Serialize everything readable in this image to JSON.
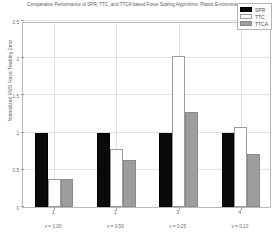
{
  "chart_data": {
    "type": "bar",
    "title": "Comparative Performance of SPR, TTC, and TTCA based Force Scaling Algorithms: Plastic Environment",
    "xlabel": "",
    "ylabel": "Normalized RMS Force Tracking Error",
    "categories": [
      "1",
      "2",
      "3",
      "4"
    ],
    "group_sublabels": [
      "v = 1.00",
      "v = 0.50",
      "v = 0.25",
      "v = 0.10"
    ],
    "series": [
      {
        "name": "SPR",
        "color": "#0a0a0a",
        "values": [
          1.0,
          1.0,
          1.0,
          1.0
        ]
      },
      {
        "name": "TTC",
        "color": "#ffffff",
        "values": [
          0.37,
          0.78,
          2.03,
          1.07
        ]
      },
      {
        "name": "TTCA",
        "color": "#9d9d9d",
        "values": [
          0.37,
          0.63,
          1.28,
          0.71
        ]
      }
    ],
    "ylim": [
      0,
      2.5
    ],
    "yticks": [
      "0",
      "0.5",
      "1",
      "1.5",
      "2",
      "2.5"
    ],
    "ytick_values": [
      0,
      0.5,
      1,
      1.5,
      2,
      2.5
    ],
    "grid": true,
    "legend_position": "top-right"
  },
  "legend": {
    "entries": [
      {
        "label": "SPR"
      },
      {
        "label": "TTC"
      },
      {
        "label": "TTCA"
      }
    ]
  }
}
